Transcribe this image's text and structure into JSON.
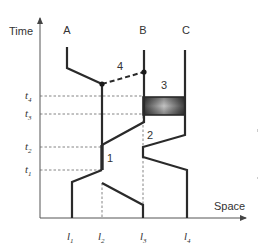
{
  "axes": {
    "y_label": "Time",
    "x_label": "Space"
  },
  "agents": [
    {
      "id": "A",
      "label": "A"
    },
    {
      "id": "B",
      "label": "B"
    },
    {
      "id": "C",
      "label": "C"
    }
  ],
  "events": [
    {
      "id": "1",
      "label": "1"
    },
    {
      "id": "2",
      "label": "2"
    },
    {
      "id": "3",
      "label": "3"
    },
    {
      "id": "4",
      "label": "4"
    }
  ],
  "time_ticks": [
    {
      "base": "t",
      "sub": "1"
    },
    {
      "base": "t",
      "sub": "2"
    },
    {
      "base": "t",
      "sub": "3"
    },
    {
      "base": "t",
      "sub": "4"
    }
  ],
  "location_ticks": [
    {
      "base": "l",
      "sub": "1"
    },
    {
      "base": "l",
      "sub": "2"
    },
    {
      "base": "l",
      "sub": "3"
    },
    {
      "base": "l",
      "sub": "4"
    }
  ],
  "colors": {
    "line": "#2a2a2a",
    "dashed": "#555555",
    "box_dark": "#3a3a3a",
    "box_light": "#c8c8c8"
  }
}
